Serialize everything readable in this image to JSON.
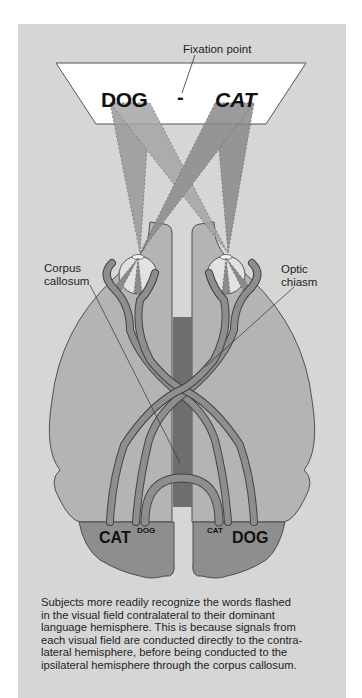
{
  "labels": {
    "fixation_point": "Fixation point",
    "corpus_callosum": "Corpus\ncallosum",
    "optic_chiasm": "Optic\nchiasm"
  },
  "screen_words": {
    "left": "DOG",
    "right": "CAT",
    "fixation_mark": "-"
  },
  "brain_words": {
    "left_hemisphere_primary": "CAT",
    "left_hemisphere_secondary": "DOG",
    "right_hemisphere_secondary": "CAT",
    "right_hemisphere_primary": "DOG"
  },
  "caption": "Subjects more readily recognize the words flashed\nin the visual field contralateral to their dominant\nlanguage hemisphere. This is because signals from\neach visual field are conducted directly to the contra-\nlateral hemisphere, before being conducted to the\nipsilateral hemisphere through the corpus callosum.",
  "colors": {
    "background": "#d6d6d6",
    "hemisphere": "#b4b4b4",
    "visual_cortex": "#8e8e8e",
    "corpus_callosum": "#6e6e6e",
    "light_rays": "#8f8f8f",
    "screen": "#ffffff"
  }
}
